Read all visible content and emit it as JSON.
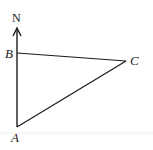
{
  "diagram": {
    "type": "geometry-bearing-triangle",
    "north_label": "N",
    "points": {
      "A": {
        "label": "A",
        "x": 17,
        "y": 127
      },
      "B": {
        "label": "B",
        "x": 17,
        "y": 53
      },
      "C": {
        "label": "C",
        "x": 126,
        "y": 61
      }
    },
    "segments": [
      "AB",
      "BC",
      "CA"
    ],
    "north_arrow": {
      "from": "A",
      "direction": "up"
    },
    "colors": {
      "stroke": "#1a1a1a",
      "background": "#ffffff",
      "baseline": "#e6e6e6"
    }
  }
}
